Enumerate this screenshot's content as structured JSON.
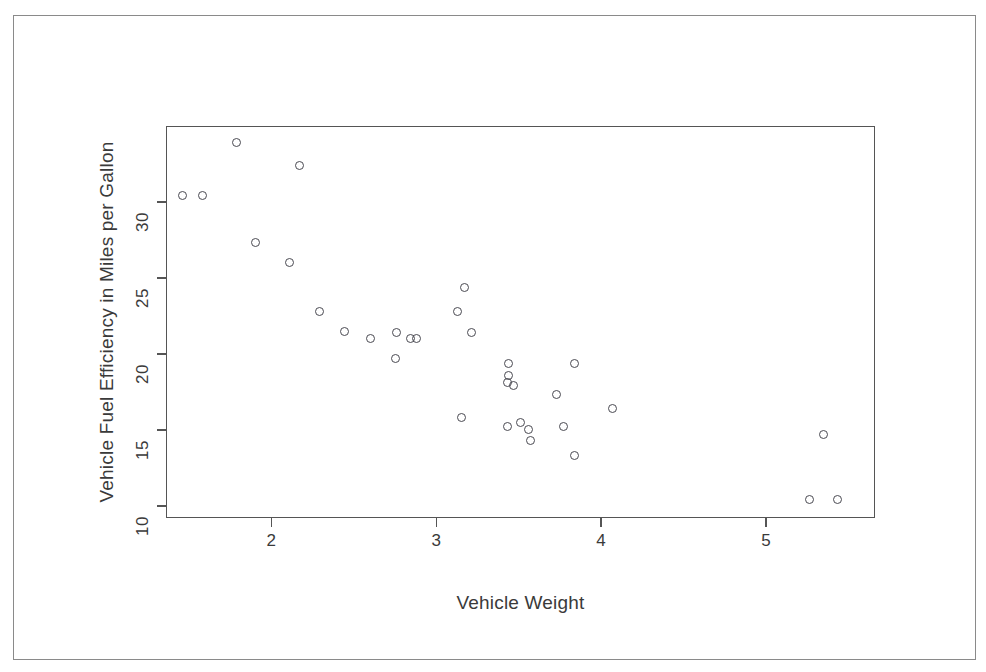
{
  "figure": {
    "background_color": "#ffffff",
    "frame_color": "#8a8a8a",
    "axis_color": "#555555",
    "point_color": "#4a4a52"
  },
  "chart_data": {
    "type": "scatter",
    "title": "",
    "xlabel": "Vehicle Weight",
    "ylabel": "Vehicle Fuel Efficiency in Miles per Gallon",
    "xlim": [
      1.36,
      5.66
    ],
    "ylim": [
      9.2,
      35.0
    ],
    "xticks": [
      2,
      3,
      4,
      5
    ],
    "xticklabels": [
      "2",
      "3",
      "4",
      "5"
    ],
    "yticks": [
      10,
      15,
      20,
      25,
      30
    ],
    "yticklabels": [
      "10",
      "15",
      "20",
      "25",
      "30"
    ],
    "grid": false,
    "legend": null,
    "marker": "open-circle",
    "n_points": 32,
    "x": [
      1.46,
      1.58,
      1.79,
      1.9,
      2.11,
      2.17,
      2.29,
      2.44,
      2.6,
      2.75,
      2.76,
      2.84,
      2.88,
      3.13,
      3.15,
      3.17,
      3.21,
      3.43,
      3.43,
      3.44,
      3.44,
      3.47,
      3.51,
      3.56,
      3.57,
      3.73,
      3.77,
      3.84,
      3.84,
      4.07,
      5.26,
      5.35,
      5.43
    ],
    "y": [
      30.4,
      30.4,
      33.9,
      27.3,
      26.0,
      32.4,
      22.8,
      21.5,
      21.0,
      19.7,
      21.4,
      21.0,
      21.0,
      22.8,
      15.8,
      24.4,
      21.4,
      18.1,
      15.2,
      19.4,
      18.6,
      17.9,
      15.5,
      15.0,
      14.3,
      17.3,
      15.2,
      19.4,
      13.3,
      16.4,
      10.4,
      14.7,
      10.4
    ]
  }
}
